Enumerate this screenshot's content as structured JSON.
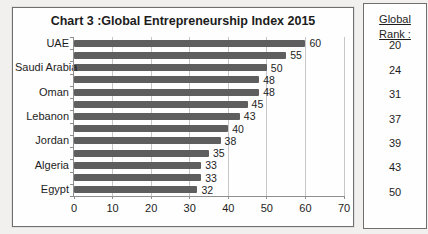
{
  "page": {
    "background": "#f1f0ee"
  },
  "chart": {
    "bar_color": "#5e5e5e",
    "grid_color": "#c7c7c7",
    "axis_color": "#8f8f8f",
    "border_color": "#6f6f6f",
    "text_color": "#1d1d1d"
  },
  "chart_data": {
    "type": "bar",
    "orientation": "horizontal",
    "title": "Chart 3 :Global Entrepreneurship Index 2015",
    "categories": [
      "UAE",
      "",
      "Saudi Arabia",
      "",
      "Oman",
      "",
      "Lebanon",
      "",
      "Jordan",
      "",
      "Algeria",
      "",
      "Egypt"
    ],
    "values": [
      60,
      55,
      50,
      48,
      48,
      45,
      43,
      40,
      38,
      35,
      33,
      33,
      32
    ],
    "xlabel": "",
    "ylabel": "",
    "xlim": [
      0,
      70
    ],
    "xticks": [
      0,
      10,
      20,
      30,
      40,
      50,
      60,
      70
    ],
    "grid": true,
    "value_labels": true,
    "legend": "none"
  },
  "rank_panel": {
    "header_line1": "Global",
    "header_line2": "Rank :",
    "ranks": [
      "20",
      "24",
      "31",
      "37",
      "39",
      "43",
      "50"
    ]
  }
}
